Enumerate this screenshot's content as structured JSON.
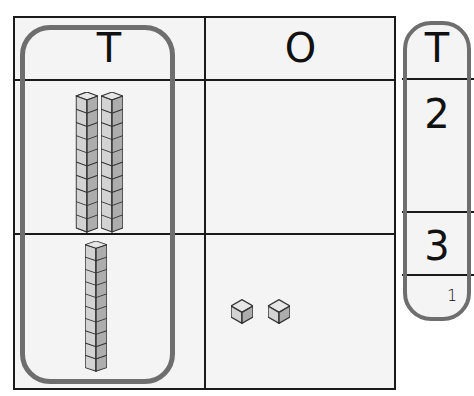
{
  "place_value_chart": {
    "headers": {
      "tens": "T",
      "ones": "O"
    },
    "rows": [
      {
        "tens_rods": 2,
        "ones_cubes": 0
      },
      {
        "tens_rods": 1,
        "ones_cubes": 2
      }
    ],
    "highlight": "tens column circled"
  },
  "digit_column": {
    "header": "T",
    "digits": [
      "2",
      "3"
    ],
    "carry": "1"
  },
  "colors": {
    "grid_line": "#1a1a1a",
    "highlight_outline": "#6e6e6e",
    "cell_background": "#f4f4f4",
    "block_face_light": "#e2e2e2",
    "block_face_mid": "#cfcfcf",
    "block_face_dark": "#a9a9a9"
  }
}
